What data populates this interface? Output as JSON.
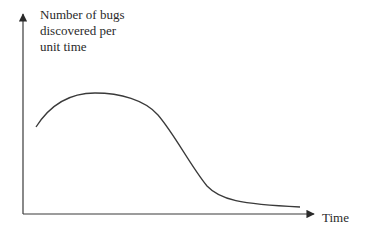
{
  "diagram": {
    "y_axis_label_lines": [
      "Number of bugs",
      "discovered per",
      "unit time"
    ],
    "x_axis_label": "Time",
    "curve_description": "Rises to a peak early, then declines steeply and levels off near zero",
    "colors": {
      "line": "#3a3a3a",
      "background": "#ffffff"
    }
  }
}
